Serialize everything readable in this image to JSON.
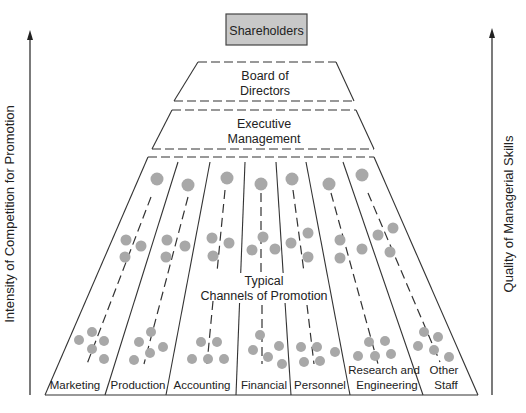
{
  "diagram": {
    "top_box": {
      "label": "Shareholders",
      "fill": "#c8c8c8"
    },
    "board": {
      "line1": "Board of",
      "line2": "Directors"
    },
    "executive": {
      "line1": "Executive",
      "line2": "Management"
    },
    "center_label": {
      "line1": "Typical",
      "line2": "Channels of Promotion"
    },
    "left_axis": {
      "label": "Intensity of Competition for Promotion"
    },
    "right_axis": {
      "label": "Quality of Managerial Skills"
    },
    "departments": [
      {
        "label": "Marketing"
      },
      {
        "label": "Production"
      },
      {
        "label": "Accounting"
      },
      {
        "label": "Financial"
      },
      {
        "label": "Personnel"
      },
      {
        "label_line1": "Research and",
        "label_line2": "Engineering"
      },
      {
        "label_line1": "Other",
        "label_line2": "Staff"
      }
    ],
    "colors": {
      "dot": "#a8a8a8",
      "line": "#333333"
    }
  }
}
